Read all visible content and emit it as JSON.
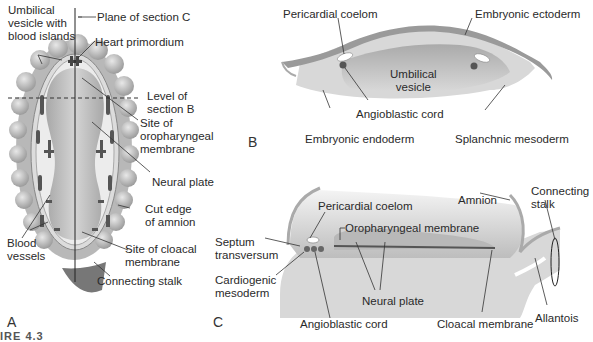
{
  "panels": {
    "A": {
      "letter": "A",
      "labels": {
        "umbilical_vesicle": "Umbilical\nvesicle with\nblood islands",
        "plane_c": "Plane of section C",
        "heart": "Heart primordium",
        "level_b": "Level of\nsection B",
        "oropharyngeal": "Site of\noropharyngeal\nmembrane",
        "neural_plate": "Neural plate",
        "amnion_edge": "Cut edge\nof amnion",
        "blood_vessels": "Blood\nvessels",
        "cloacal": "Site of cloacal\nmembrane",
        "connecting_stalk": "Connecting stalk"
      }
    },
    "B": {
      "letter": "B",
      "labels": {
        "pericardial": "Pericardial coelom",
        "ectoderm": "Embryonic ectoderm",
        "umbilical": "Umbilical\nvesicle",
        "angioblastic": "Angioblastic cord",
        "endoderm": "Embryonic endoderm",
        "splanchnic": "Splanchnic mesoderm"
      }
    },
    "C": {
      "letter": "C",
      "labels": {
        "pericardial": "Pericardial coelom",
        "amnion": "Amnion",
        "connecting_stalk": "Connecting\nstalk",
        "oropharyngeal": "Oropharyngeal membrane",
        "septum": "Septum\ntransversum",
        "cardiogenic": "Cardiogenic\nmesoderm",
        "neural_plate": "Neural plate",
        "angioblastic": "Angioblastic cord",
        "cloacal": "Cloacal membrane",
        "allantois": "Allantois"
      }
    }
  },
  "caption": "IRE 4.3",
  "colors": {
    "vesicle_dark": "#9a9a9a",
    "vesicle_light": "#cfcfcf",
    "disc_fill": "#e6e6e6",
    "neural": "#b5b5b5",
    "dark_vessel": "#555555",
    "line": "#333333"
  }
}
